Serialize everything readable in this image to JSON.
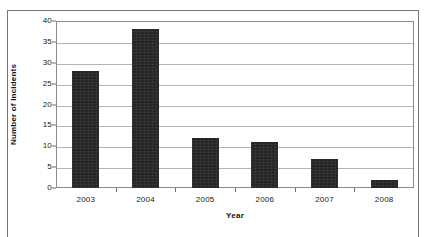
{
  "chart_data": {
    "type": "bar",
    "title": "",
    "xlabel": "Year",
    "ylabel": "Number of Incidents",
    "categories": [
      "2003",
      "2004",
      "2005",
      "2006",
      "2007",
      "2008"
    ],
    "values": [
      28,
      38,
      12,
      11,
      7,
      2
    ],
    "ylim": [
      0,
      40
    ],
    "y_ticks": [
      0,
      5,
      10,
      15,
      20,
      25,
      30,
      35,
      40
    ],
    "y_tick_labels": [
      "0",
      "5",
      "10",
      "15",
      "20",
      "25",
      "30",
      "35",
      "40"
    ],
    "grid": true,
    "legend": "none",
    "bar_color": "#262626",
    "gridline_color": "#b4b4b4",
    "frame_color": "#8a8a8a",
    "background_color": "#ffffff"
  }
}
